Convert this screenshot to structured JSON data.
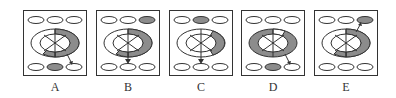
{
  "figure": {
    "type": "visual-reasoning-options",
    "colors": {
      "stroke": "#333333",
      "shade": "#8c8c8c",
      "fill": "#ffffff"
    },
    "options": [
      {
        "label": "A",
        "top_shaded": [],
        "bottom_shaded": [
          1
        ],
        "ring_shading": "right-and-bottom",
        "arrow": "ring-to-bottom-right"
      },
      {
        "label": "B",
        "top_shaded": [
          2
        ],
        "bottom_shaded": [],
        "ring_shading": "right-and-bottom",
        "arrow": "down-to-bottom-middle"
      },
      {
        "label": "C",
        "top_shaded": [
          1
        ],
        "bottom_shaded": [],
        "ring_shading": "right",
        "arrow": "down-to-bottom-middle"
      },
      {
        "label": "D",
        "top_shaded": [],
        "bottom_shaded": [
          1
        ],
        "ring_shading": "full-except-top",
        "arrow": "ring-to-bottom-right"
      },
      {
        "label": "E",
        "top_shaded": [
          2
        ],
        "bottom_shaded": [],
        "ring_shading": "right-and-bottom",
        "arrow": "ring-to-top-right"
      }
    ]
  }
}
